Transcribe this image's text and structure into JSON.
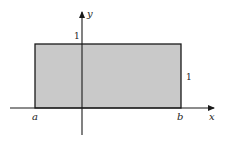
{
  "diagram": {
    "type": "rectangle-region-on-axes",
    "colors": {
      "background": "#ffffff",
      "fill": "#c9c9c9",
      "stroke": "#1a1a1a"
    },
    "axes": {
      "x_label": "x",
      "y_label": "y"
    },
    "labels": {
      "left_bound": "a",
      "right_bound": "b",
      "height_on_y_axis": "1",
      "height_on_right_side": "1"
    }
  }
}
